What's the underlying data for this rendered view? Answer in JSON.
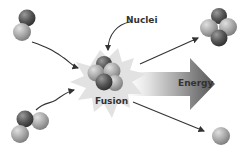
{
  "diagram": {
    "labels": {
      "nuclei": "Nuclei",
      "fusion": "Fusion",
      "energy": "Energy"
    },
    "inputs": [
      {
        "name": "deuterium",
        "particles": 2
      },
      {
        "name": "tritium",
        "particles": 3
      }
    ],
    "outputs": [
      {
        "name": "helium",
        "particles": 4
      },
      {
        "name": "neutron",
        "particles": 1
      }
    ],
    "colors": {
      "proton": "#555555",
      "neutron": "#aaaaaa",
      "burst": "#e2e2e2",
      "arrow": "#333333"
    }
  }
}
